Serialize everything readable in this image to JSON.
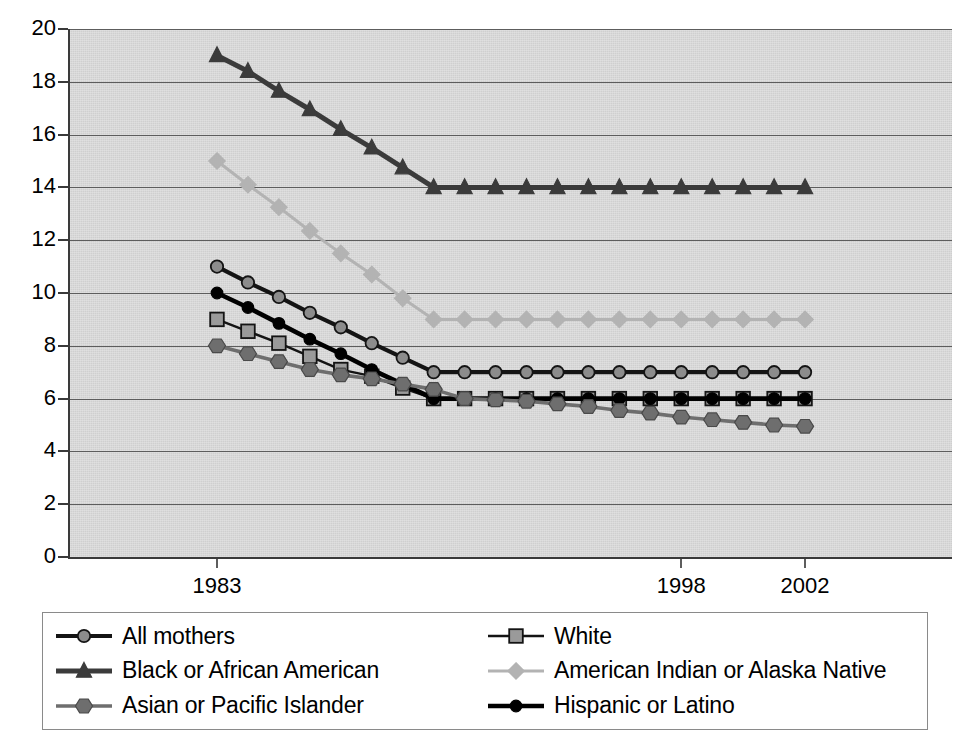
{
  "chart_data": {
    "type": "line",
    "title": "",
    "subtitle": "",
    "xlabel": "",
    "ylabel": "",
    "ylim": [
      0,
      20
    ],
    "ytick_labels": [
      "0",
      "2",
      "4",
      "6",
      "8",
      "10",
      "12",
      "14",
      "16",
      "18",
      "20"
    ],
    "ytick_values": [
      0,
      2,
      4,
      6,
      8,
      10,
      12,
      14,
      16,
      18,
      20
    ],
    "grid": "horizontal",
    "legend_position": "bottom",
    "x": [
      1983,
      1984,
      1985,
      1986,
      1987,
      1988,
      1989,
      1990,
      1991,
      1992,
      1993,
      1994,
      1995,
      1996,
      1997,
      1998,
      1999,
      2000,
      2001,
      2002
    ],
    "xtick_labels": [
      "1983",
      "1998",
      "2002"
    ],
    "xtick_values": [
      1983,
      1998,
      2002
    ],
    "series": [
      {
        "name": "All mothers",
        "marker": "circle",
        "line_color": "#141414",
        "marker_fill": "#8c8c8c",
        "marker_stroke": "#141414",
        "values": [
          11.0,
          10.4,
          9.85,
          9.25,
          8.7,
          8.1,
          7.55,
          7.0,
          7.0,
          7.0,
          7.0,
          7.0,
          7.0,
          7.0,
          7.0,
          7.0,
          7.0,
          7.0,
          7.0,
          7.0
        ]
      },
      {
        "name": "White",
        "marker": "square",
        "line_color": "#141414",
        "marker_fill": "#9a9a9a",
        "marker_stroke": "#141414",
        "values": [
          9.0,
          8.55,
          8.1,
          7.6,
          7.1,
          6.85,
          6.4,
          6.0,
          6.0,
          6.0,
          6.0,
          6.0,
          6.0,
          6.0,
          6.0,
          6.0,
          6.0,
          6.0,
          6.0,
          6.0
        ]
      },
      {
        "name": "Black or African American",
        "marker": "triangle",
        "line_color": "#3b3b3b",
        "marker_fill": "#3b3b3b",
        "marker_stroke": "#3b3b3b",
        "values": [
          19.0,
          18.4,
          17.65,
          16.95,
          16.2,
          15.5,
          14.75,
          14.0,
          14.0,
          14.0,
          14.0,
          14.0,
          14.0,
          14.0,
          14.0,
          14.0,
          14.0,
          14.0,
          14.0,
          14.0
        ]
      },
      {
        "name": "American Indian or Alaska Native",
        "marker": "diamond",
        "line_color": "#b3b3b3",
        "marker_fill": "#b3b3b3",
        "marker_stroke": "#b3b3b3",
        "values": [
          15.0,
          14.1,
          13.25,
          12.35,
          11.5,
          10.7,
          9.8,
          9.0,
          9.0,
          9.0,
          9.0,
          9.0,
          9.0,
          9.0,
          9.0,
          9.0,
          9.0,
          9.0,
          9.0,
          9.0
        ]
      },
      {
        "name": "Asian or Pacific Islander",
        "marker": "hexagon",
        "line_color": "#6e6e6e",
        "marker_fill": "#6e6e6e",
        "marker_stroke": "#4a4a4a",
        "values": [
          8.0,
          7.7,
          7.4,
          7.1,
          6.9,
          6.75,
          6.55,
          6.35,
          6.0,
          5.95,
          5.9,
          5.8,
          5.7,
          5.55,
          5.45,
          5.3,
          5.2,
          5.1,
          5.0,
          4.95
        ]
      },
      {
        "name": "Hispanic or Latino",
        "marker": "circle-filled",
        "line_color": "#000000",
        "marker_fill": "#000000",
        "marker_stroke": "#000000",
        "values": [
          10.0,
          9.45,
          8.85,
          8.25,
          7.7,
          7.1,
          6.55,
          6.0,
          6.0,
          6.0,
          6.0,
          6.0,
          6.0,
          6.0,
          6.0,
          6.0,
          6.0,
          6.0,
          6.0,
          6.0
        ]
      }
    ]
  },
  "legend": {
    "items": [
      {
        "label": "All mothers"
      },
      {
        "label": "White"
      },
      {
        "label": "Black or African American"
      },
      {
        "label": "American Indian or Alaska Native"
      },
      {
        "label": "Asian or Pacific Islander"
      },
      {
        "label": "Hispanic or Latino"
      }
    ]
  },
  "colors": {
    "plot_background": "#cfcfcf",
    "axis": "#3a3a3a",
    "gridline": "#5d5d5d",
    "page_background": "#ffffff",
    "text": "#000000"
  }
}
